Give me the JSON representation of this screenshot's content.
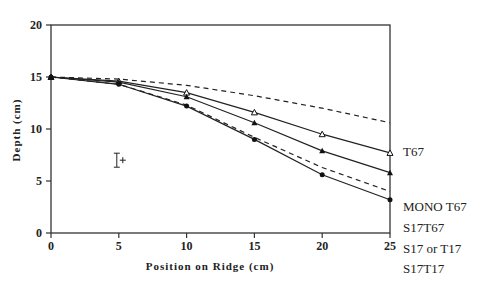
{
  "chart_data": {
    "type": "line",
    "title": "",
    "xlabel": "Position on Ridge (cm)",
    "ylabel": "Depth (cm)",
    "xlim": [
      0,
      25
    ],
    "ylim": [
      0,
      20
    ],
    "xticks": [
      0,
      5,
      10,
      15,
      20,
      25
    ],
    "yticks": [
      0,
      5,
      10,
      15,
      20
    ],
    "grid": false,
    "legend_position": "right, inline labels at line ends",
    "x": [
      0,
      5,
      10,
      15,
      20,
      25
    ],
    "series": [
      {
        "name": "T67",
        "style": "dashed",
        "marker": "none",
        "values": [
          15,
          14.8,
          14.2,
          13.2,
          12.0,
          10.6
        ]
      },
      {
        "name": "MONO T67",
        "style": "solid",
        "marker": "open-triangle",
        "values": [
          15,
          14.6,
          13.5,
          11.6,
          9.5,
          7.7
        ]
      },
      {
        "name": "S17T67",
        "style": "solid",
        "marker": "filled-triangle",
        "values": [
          15,
          14.5,
          13.1,
          10.6,
          7.9,
          5.8
        ]
      },
      {
        "name": "S17 or T17",
        "style": "dashed",
        "marker": "none",
        "values": [
          15,
          14.3,
          12.3,
          9.2,
          6.3,
          4.0
        ]
      },
      {
        "name": "S17T17",
        "style": "solid",
        "marker": "filled-circle",
        "values": [
          15,
          14.3,
          12.2,
          9.0,
          5.6,
          3.2
        ]
      }
    ],
    "annotations": [
      {
        "type": "error-bar-symbol",
        "x": 5,
        "y": 7.0,
        "text": "+"
      }
    ]
  }
}
